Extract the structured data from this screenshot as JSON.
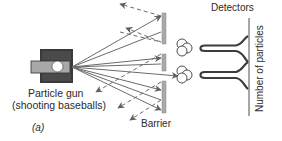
{
  "figure": {
    "panel_label": "(a)",
    "gun": {
      "label_line1": "Particle gun",
      "label_line2": "(shooting baseballs)"
    },
    "barrier": {
      "label": "Barrier"
    },
    "detectors": {
      "title": "Detectors",
      "axis_label": "Number of particles",
      "peaks": 2
    },
    "colors": {
      "gun_body": "#3a3a3a",
      "gun_barrel": "#a8a8a8",
      "ray": "#6b6b6b",
      "barrier": "#a9a9a9",
      "curve": "#3c3c3c",
      "text": "#2a2a2a"
    }
  }
}
